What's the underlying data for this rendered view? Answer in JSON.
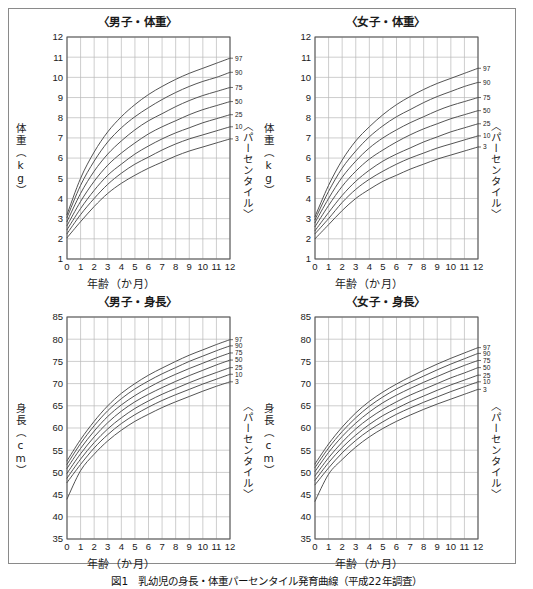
{
  "figure": {
    "caption": "図1　乳幼児の身長・体重パーセンタイル発育曲線（平成22年調査）",
    "percentile_axis_label": "〈パーセンタイル〉",
    "x_axis_label": "年齢（か月）",
    "percentile_labels": [
      "97",
      "90",
      "75",
      "50",
      "25",
      "10",
      "3"
    ]
  },
  "charts": [
    {
      "id": "boys-weight",
      "title": "〈男子・体重〉",
      "y_axis_label": "体重（kg）",
      "x_axis_label": "年齢（か月）",
      "percentile_axis_label": "〈パーセンタイル〉"
    },
    {
      "id": "girls-weight",
      "title": "〈女子・体重〉",
      "y_axis_label": "体重（kg）",
      "x_axis_label": "年齢（か月）",
      "percentile_axis_label": "〈パーセンタイル〉"
    },
    {
      "id": "boys-height",
      "title": "〈男子・身長〉",
      "y_axis_label": "身長（cm）",
      "x_axis_label": "年齢（か月）",
      "percentile_axis_label": "〈パーセンタイル〉"
    },
    {
      "id": "girls-height",
      "title": "〈女子・身長〉",
      "y_axis_label": "身長（cm）",
      "x_axis_label": "年齢（か月）",
      "percentile_axis_label": "〈パーセンタイル〉"
    }
  ],
  "chart_data": [
    {
      "type": "line",
      "id": "boys-weight",
      "title": "〈男子・体重〉",
      "xlabel": "年齢（か月）",
      "ylabel": "体重（kg）",
      "xlim": [
        0,
        12
      ],
      "ylim": [
        1,
        12
      ],
      "xticks": [
        0,
        1,
        2,
        3,
        4,
        5,
        6,
        7,
        8,
        9,
        10,
        11,
        12
      ],
      "yticks": [
        1,
        2,
        3,
        4,
        5,
        6,
        7,
        8,
        9,
        10,
        11,
        12
      ],
      "grid": true,
      "legend_position": "right-outside",
      "x": [
        0,
        1,
        2,
        3,
        4,
        5,
        6,
        7,
        8,
        9,
        10,
        11,
        12
      ],
      "series": [
        {
          "name": "97",
          "values": [
            3.2,
            5.0,
            6.3,
            7.3,
            8.05,
            8.65,
            9.15,
            9.55,
            9.9,
            10.2,
            10.45,
            10.7,
            10.95
          ]
        },
        {
          "name": "90",
          "values": [
            3.05,
            4.65,
            5.85,
            6.8,
            7.5,
            8.05,
            8.5,
            8.9,
            9.25,
            9.55,
            9.8,
            10.0,
            10.25
          ]
        },
        {
          "name": "75",
          "values": [
            2.85,
            4.25,
            5.35,
            6.2,
            6.85,
            7.4,
            7.85,
            8.2,
            8.55,
            8.85,
            9.1,
            9.3,
            9.5
          ]
        },
        {
          "name": "50",
          "values": [
            2.65,
            3.85,
            4.85,
            5.65,
            6.25,
            6.75,
            7.2,
            7.55,
            7.85,
            8.15,
            8.4,
            8.6,
            8.8
          ]
        },
        {
          "name": "25",
          "values": [
            2.45,
            3.5,
            4.4,
            5.15,
            5.7,
            6.2,
            6.6,
            6.95,
            7.25,
            7.5,
            7.75,
            7.95,
            8.15
          ]
        },
        {
          "name": "10",
          "values": [
            2.25,
            3.2,
            4.0,
            4.7,
            5.25,
            5.7,
            6.05,
            6.4,
            6.7,
            6.95,
            7.15,
            7.35,
            7.55
          ]
        },
        {
          "name": "3",
          "values": [
            2.05,
            2.85,
            3.6,
            4.25,
            4.75,
            5.15,
            5.5,
            5.8,
            6.1,
            6.35,
            6.55,
            6.75,
            6.95
          ]
        }
      ]
    },
    {
      "type": "line",
      "id": "girls-weight",
      "title": "〈女子・体重〉",
      "xlabel": "年齢（か月）",
      "ylabel": "体重（kg）",
      "xlim": [
        0,
        12
      ],
      "ylim": [
        1,
        12
      ],
      "xticks": [
        0,
        1,
        2,
        3,
        4,
        5,
        6,
        7,
        8,
        9,
        10,
        11,
        12
      ],
      "yticks": [
        1,
        2,
        3,
        4,
        5,
        6,
        7,
        8,
        9,
        10,
        11,
        12
      ],
      "grid": true,
      "legend_position": "right-outside",
      "x": [
        0,
        1,
        2,
        3,
        4,
        5,
        6,
        7,
        8,
        9,
        10,
        11,
        12
      ],
      "series": [
        {
          "name": "97",
          "values": [
            3.1,
            4.65,
            5.9,
            6.85,
            7.55,
            8.15,
            8.65,
            9.05,
            9.4,
            9.7,
            9.95,
            10.2,
            10.45
          ]
        },
        {
          "name": "90",
          "values": [
            2.95,
            4.35,
            5.5,
            6.35,
            7.05,
            7.6,
            8.05,
            8.4,
            8.75,
            9.05,
            9.3,
            9.55,
            9.75
          ]
        },
        {
          "name": "75",
          "values": [
            2.8,
            4.0,
            5.05,
            5.85,
            6.5,
            7.0,
            7.4,
            7.75,
            8.05,
            8.35,
            8.6,
            8.8,
            9.0
          ]
        },
        {
          "name": "50",
          "values": [
            2.6,
            3.65,
            4.6,
            5.35,
            5.95,
            6.4,
            6.8,
            7.15,
            7.45,
            7.7,
            7.95,
            8.15,
            8.35
          ]
        },
        {
          "name": "25",
          "values": [
            2.4,
            3.3,
            4.15,
            4.85,
            5.4,
            5.85,
            6.2,
            6.5,
            6.8,
            7.05,
            7.3,
            7.5,
            7.7
          ]
        },
        {
          "name": "10",
          "values": [
            2.25,
            3.0,
            3.8,
            4.45,
            4.95,
            5.35,
            5.7,
            6.0,
            6.25,
            6.5,
            6.7,
            6.9,
            7.1
          ]
        },
        {
          "name": "3",
          "values": [
            2.0,
            2.7,
            3.4,
            4.0,
            4.45,
            4.85,
            5.15,
            5.45,
            5.7,
            5.95,
            6.15,
            6.35,
            6.55
          ]
        }
      ]
    },
    {
      "type": "line",
      "id": "boys-height",
      "title": "〈男子・身長〉",
      "xlabel": "年齢（か月）",
      "ylabel": "身長（cm）",
      "xlim": [
        0,
        12
      ],
      "ylim": [
        35,
        85
      ],
      "xticks": [
        0,
        1,
        2,
        3,
        4,
        5,
        6,
        7,
        8,
        9,
        10,
        11,
        12
      ],
      "yticks": [
        35,
        40,
        45,
        50,
        55,
        60,
        65,
        70,
        75,
        80,
        85
      ],
      "grid": true,
      "legend_position": "right-outside",
      "x": [
        0,
        1,
        2,
        3,
        4,
        5,
        6,
        7,
        8,
        9,
        10,
        11,
        12
      ],
      "series": [
        {
          "name": "97",
          "values": [
            52.6,
            57.4,
            61.5,
            65.0,
            67.8,
            70.0,
            71.9,
            73.5,
            75.0,
            76.4,
            77.6,
            78.8,
            79.9
          ]
        },
        {
          "name": "90",
          "values": [
            51.8,
            56.5,
            60.5,
            63.9,
            66.6,
            68.8,
            70.6,
            72.2,
            73.6,
            75.0,
            76.2,
            77.4,
            78.5
          ]
        },
        {
          "name": "75",
          "values": [
            50.9,
            55.4,
            59.3,
            62.6,
            65.2,
            67.3,
            69.1,
            70.7,
            72.1,
            73.4,
            74.6,
            75.8,
            76.9
          ]
        },
        {
          "name": "50",
          "values": [
            49.8,
            54.2,
            58.0,
            61.2,
            63.8,
            65.9,
            67.6,
            69.1,
            70.5,
            71.8,
            73.0,
            74.2,
            75.3
          ]
        },
        {
          "name": "25",
          "values": [
            48.7,
            53.0,
            56.7,
            59.8,
            62.3,
            64.4,
            66.1,
            67.6,
            68.9,
            70.2,
            71.4,
            72.5,
            73.6
          ]
        },
        {
          "name": "10",
          "values": [
            47.7,
            51.8,
            55.5,
            58.5,
            61.0,
            63.0,
            64.7,
            66.2,
            67.5,
            68.7,
            69.9,
            71.0,
            72.1
          ]
        },
        {
          "name": "3",
          "values": [
            44.0,
            50.4,
            54.1,
            57.1,
            59.5,
            61.5,
            63.1,
            64.6,
            65.9,
            67.1,
            68.3,
            69.4,
            70.4
          ]
        }
      ]
    },
    {
      "type": "line",
      "id": "girls-height",
      "title": "〈女子・身長〉",
      "xlabel": "年齢（か月）",
      "ylabel": "身長（cm）",
      "xlim": [
        0,
        12
      ],
      "ylim": [
        35,
        85
      ],
      "xticks": [
        0,
        1,
        2,
        3,
        4,
        5,
        6,
        7,
        8,
        9,
        10,
        11,
        12
      ],
      "yticks": [
        35,
        40,
        45,
        50,
        55,
        60,
        65,
        70,
        75,
        80,
        85
      ],
      "grid": true,
      "legend_position": "right-outside",
      "x": [
        0,
        1,
        2,
        3,
        4,
        5,
        6,
        7,
        8,
        9,
        10,
        11,
        12
      ],
      "series": [
        {
          "name": "97",
          "values": [
            51.9,
            56.4,
            60.2,
            63.4,
            66.0,
            68.1,
            69.9,
            71.5,
            73.0,
            74.4,
            75.7,
            76.9,
            78.1
          ]
        },
        {
          "name": "90",
          "values": [
            51.1,
            55.5,
            59.2,
            62.3,
            64.9,
            67.0,
            68.8,
            70.3,
            71.7,
            73.1,
            74.4,
            75.6,
            76.8
          ]
        },
        {
          "name": "75",
          "values": [
            50.2,
            54.5,
            58.1,
            61.1,
            63.6,
            65.7,
            67.4,
            68.9,
            70.3,
            71.6,
            72.9,
            74.1,
            75.2
          ]
        },
        {
          "name": "50",
          "values": [
            49.2,
            53.3,
            56.8,
            59.8,
            62.2,
            64.2,
            65.9,
            67.4,
            68.7,
            70.0,
            71.3,
            72.4,
            73.6
          ]
        },
        {
          "name": "25",
          "values": [
            48.2,
            52.2,
            55.6,
            58.4,
            60.8,
            62.8,
            64.4,
            65.9,
            67.2,
            68.5,
            69.7,
            70.8,
            71.9
          ]
        },
        {
          "name": "10",
          "values": [
            47.2,
            51.0,
            54.4,
            57.2,
            59.5,
            61.4,
            63.1,
            64.5,
            65.8,
            67.0,
            68.2,
            69.3,
            70.4
          ]
        },
        {
          "name": "3",
          "values": [
            43.5,
            49.6,
            52.9,
            55.7,
            58.0,
            59.9,
            61.5,
            62.9,
            64.2,
            65.4,
            66.5,
            67.6,
            68.7
          ]
        }
      ]
    }
  ]
}
